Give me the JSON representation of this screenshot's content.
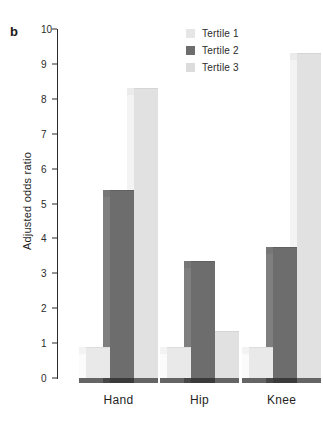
{
  "figure": {
    "panel_label": "b",
    "background": "#ffffff"
  },
  "chart_data": {
    "type": "bar",
    "title": "",
    "subtitle": "",
    "xlabel": "",
    "ylabel": "Adjusted odds ratio",
    "categories": [
      "Hand",
      "Hip",
      "Knee"
    ],
    "series": [
      {
        "name": "Tertile 1",
        "values": [
          0.9,
          0.9,
          0.9
        ],
        "color": "#e9e9e9"
      },
      {
        "name": "Tertile 2",
        "values": [
          5.4,
          3.35,
          3.75
        ],
        "color": "#6d6d6d"
      },
      {
        "name": "Tertile 3",
        "values": [
          8.3,
          1.35,
          9.3
        ],
        "color": "#e1e1e1"
      }
    ],
    "ylim": [
      0,
      10
    ],
    "yticks": [
      0,
      1,
      2,
      3,
      4,
      5,
      6,
      7,
      8,
      9,
      10
    ],
    "ytick_labels": [
      "0",
      "1",
      "2",
      "3",
      "4",
      "5",
      "6",
      "7",
      "8",
      "9",
      "10"
    ],
    "grid": false,
    "legend_position": "top-right",
    "style_3d": true
  },
  "legend": {
    "items": [
      {
        "label": "Tertile 1",
        "color": "#e6e6e6"
      },
      {
        "label": "Tertile 2",
        "color": "#6d6d6d"
      },
      {
        "label": "Tertile 3",
        "color": "#dcdcdc"
      }
    ]
  },
  "axis": {
    "line_color": "#2b2b2b",
    "tick_color": "#2b2b2b",
    "text_color": "#1f1f1f"
  }
}
